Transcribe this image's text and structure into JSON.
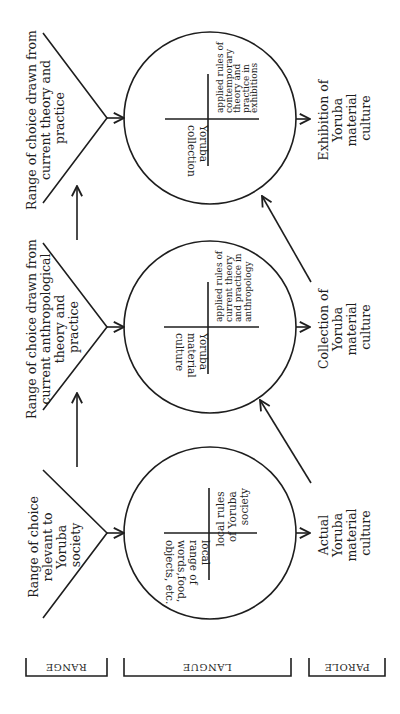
{
  "diagram": {
    "orientation": "rotated 90deg counter-clockwise",
    "bands": [
      {
        "id": "range",
        "label": "RANGE"
      },
      {
        "id": "langue",
        "label": "LANGUE"
      },
      {
        "id": "parole",
        "label": "PAROLE"
      }
    ],
    "stages": [
      {
        "range_lines": [
          "Range of choice",
          "relevant to",
          "Yoruba",
          "society"
        ],
        "circle_left_lines": [
          "local",
          "range of",
          "words,food,",
          "objects, etc."
        ],
        "circle_right_lines": [
          "local rules",
          "of Yoruba",
          "society"
        ],
        "output_lines": [
          "Actual",
          "Yoruba",
          "material",
          "culture"
        ]
      },
      {
        "range_lines": [
          "Range of choice drawn from",
          "current anthropological",
          "theory and",
          "practice"
        ],
        "circle_left_lines": [
          "Yoruba",
          "material",
          "culture"
        ],
        "circle_right_lines": [
          "applied rules of",
          "current theory",
          "and practice in",
          "anthropology"
        ],
        "output_lines": [
          "Collection of",
          "Yoruba",
          "material",
          "culture"
        ]
      },
      {
        "range_lines": [
          "Range of choice drawn from",
          "current theory and",
          "practice"
        ],
        "circle_left_lines": [
          "Yoruba",
          "collection"
        ],
        "circle_right_lines": [
          "applied rules of",
          "contemporary",
          "theory and",
          "practice in",
          "exhibitions"
        ],
        "output_lines": [
          "Exhibition of",
          "Yoruba",
          "material",
          "culture"
        ]
      }
    ],
    "colors": {
      "ink": "#1e1e1e",
      "background": "#ffffff"
    }
  }
}
